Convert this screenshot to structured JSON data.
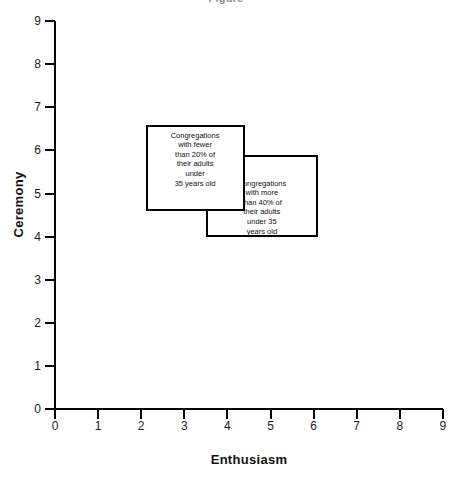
{
  "chart_data": {
    "type": "scatter",
    "title": "",
    "xlabel": "Enthusiasm",
    "ylabel": "Ceremony",
    "xlim": [
      0,
      9
    ],
    "ylim": [
      0,
      9
    ],
    "xticks": [
      "0",
      "1",
      "2",
      "3",
      "4",
      "5",
      "6",
      "7",
      "8",
      "9"
    ],
    "yticks": [
      "0",
      "1",
      "2",
      "3",
      "4",
      "5",
      "6",
      "7",
      "8",
      "9"
    ],
    "grid": false,
    "legend": "none",
    "regions": [
      {
        "name": "low-youth-congregations",
        "label": "Congregations\nwith fewer\nthan 20% of\ntheir adults\nunder\n35 years old",
        "x_range": [
          2.1,
          4.4
        ],
        "y_range": [
          4.6,
          6.6
        ]
      },
      {
        "name": "high-youth-congregations",
        "label": "Congregations\nwith more\nthan 40% of\ntheir adults\nunder 35\nyears old",
        "x_range": [
          3.5,
          6.1
        ],
        "y_range": [
          4.0,
          5.9
        ]
      }
    ]
  },
  "axes": {
    "y_title": "Ceremony",
    "x_title": "Enthusiasm"
  },
  "title_sliver": "Figure"
}
